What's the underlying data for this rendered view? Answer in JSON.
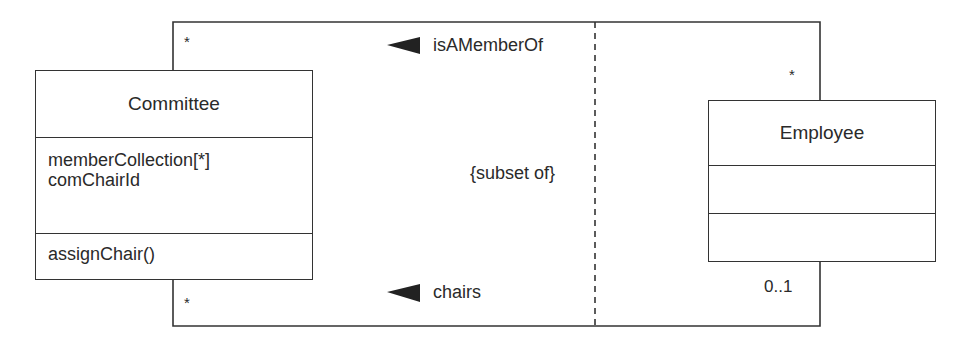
{
  "diagram": {
    "type": "UML class diagram",
    "classes": [
      {
        "name": "Committee",
        "attributes": [
          "memberCollection[*]",
          "comChairId"
        ],
        "operations": [
          "assignChair()"
        ]
      },
      {
        "name": "Employee",
        "attributes": [],
        "operations": []
      }
    ],
    "associations": [
      {
        "name": "isAMemberOf",
        "direction_arrow": "left",
        "committee_end_multiplicity": "*",
        "employee_end_multiplicity": "*"
      },
      {
        "name": "chairs",
        "direction_arrow": "left",
        "committee_end_multiplicity": "*",
        "employee_end_multiplicity": "0..1"
      }
    ],
    "constraint": "{subset of}",
    "line_color": "#333333"
  }
}
